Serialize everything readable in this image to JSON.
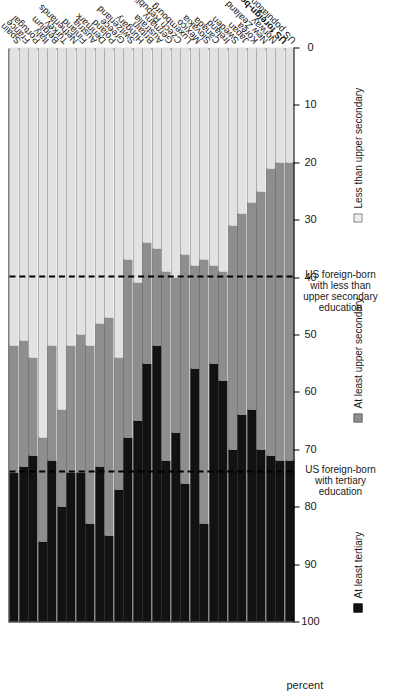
{
  "figure": {
    "axis_title": "percent",
    "legend": [
      {
        "key": "tert",
        "label": "At least tertiary",
        "color": "#121212"
      },
      {
        "key": "upsec",
        "label": "At least upper secondary",
        "color": "#8e8e8e"
      },
      {
        "key": "lesssec",
        "label": "Less than upper secondary",
        "color": "#eeeeee"
      }
    ],
    "annotations": [
      {
        "text": "US foreign-born with tertiary education",
        "at": 74
      },
      {
        "text": "US foreign-born with less than upper secondary education",
        "at": 40
      }
    ]
  },
  "chart_data": {
    "type": "bar",
    "orientation": "horizontal-stacked",
    "title": "",
    "xlabel": "percent",
    "ylabel": "",
    "xlim": [
      0,
      100
    ],
    "xticks": [
      0,
      10,
      20,
      30,
      40,
      50,
      60,
      70,
      80,
      90,
      100
    ],
    "grid": false,
    "legend_position": "bottom",
    "reference_lines": [
      {
        "value": 74,
        "style": "dashed",
        "label": "US foreign-born with tertiary education"
      },
      {
        "value": 40,
        "style": "dashed",
        "label": "US foreign-born with less than upper secondary education"
      }
    ],
    "stack_order": [
      "tert",
      "upsec",
      "lesssec"
    ],
    "series": [
      {
        "name": "At least tertiary",
        "key": "tert",
        "values": [
          26,
          27,
          29,
          14,
          28,
          20,
          26,
          26,
          17,
          27,
          15,
          23,
          32,
          35,
          45,
          48,
          28,
          33,
          24,
          44,
          17,
          45,
          42,
          30,
          36,
          37,
          30,
          29,
          28,
          28
        ]
      },
      {
        "name": "At least upper secondary",
        "key": "upsec",
        "values": [
          22,
          22,
          17,
          18,
          20,
          17,
          22,
          24,
          31,
          25,
          38,
          23,
          31,
          24,
          21,
          17,
          33,
          27,
          40,
          18,
          46,
          17,
          19,
          39,
          35,
          36,
          45,
          50,
          52,
          52
        ]
      },
      {
        "name": "Less than upper secondary",
        "key": "lesssec",
        "values": [
          52,
          51,
          54,
          68,
          52,
          63,
          52,
          50,
          52,
          48,
          47,
          54,
          37,
          41,
          34,
          35,
          39,
          40,
          36,
          38,
          37,
          38,
          39,
          31,
          29,
          27,
          25,
          21,
          20,
          20
        ]
      }
    ],
    "categories": [
      "Spain",
      "France",
      "Portugal",
      "Italy",
      "Belgium",
      "Turkey",
      "Netherlands",
      "Finland",
      "Austria",
      "Denmark",
      "Poland",
      "Greece",
      "Switzerland",
      "Hungary",
      "Britain",
      "Australia",
      "Germany",
      "Czech Republic",
      "Luxembourg",
      "Mexico",
      "Slovakia",
      "Canada",
      "Ireland",
      "Sweden",
      "Japan",
      "Korea",
      "New Zealand",
      "Norway",
      "US foreign-born",
      "US population, 2006"
    ],
    "emphasized_categories": [
      "US foreign-born"
    ]
  }
}
